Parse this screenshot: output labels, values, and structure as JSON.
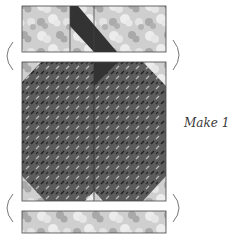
{
  "caption": "Make 1",
  "colors": {
    "light_print_base": "#cfcfcf",
    "light_print_mid": "#a9a9a9",
    "light_print_highlight": "#ececec",
    "dark_print_base": "#5c5c5c",
    "dark_print_dash_dark": "#222222",
    "dark_print_dash_light": "#bdbdbd",
    "solid_dark": "#333333",
    "seam_line": "#444444",
    "bracket": "#777777"
  },
  "pieces": [
    {
      "name": "top-strip",
      "description": "Light floral strip with dark diagonal band across center seam"
    },
    {
      "name": "main-block",
      "description": "Dark print block with snowball light corner triangles and center seam"
    },
    {
      "name": "bottom-strip",
      "description": "Light floral strip"
    }
  ],
  "brackets": [
    {
      "name": "top-left-bracket",
      "glyph": "("
    },
    {
      "name": "top-right-bracket",
      "glyph": ")"
    },
    {
      "name": "bottom-left-bracket",
      "glyph": "("
    },
    {
      "name": "bottom-right-bracket",
      "glyph": ")"
    }
  ]
}
